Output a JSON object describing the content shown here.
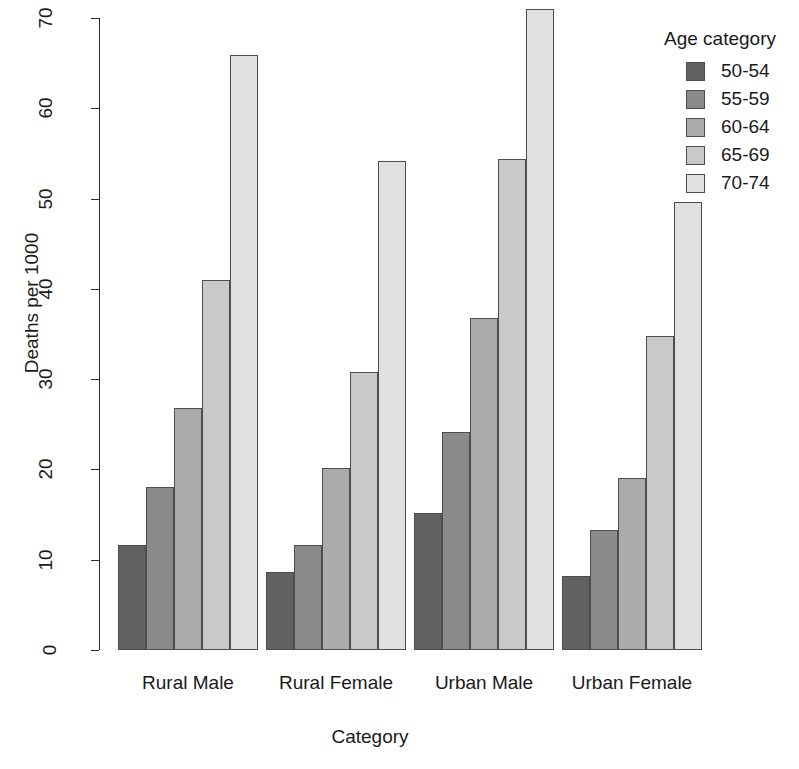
{
  "chart_data": {
    "type": "bar",
    "title": "",
    "xlabel": "Category",
    "ylabel": "Deaths per 1000",
    "categories": [
      "Rural Male",
      "Rural Female",
      "Urban Male",
      "Urban Female"
    ],
    "series": [
      {
        "name": "50-54",
        "color": "#616161",
        "values": [
          11.6,
          8.6,
          15.2,
          8.2
        ]
      },
      {
        "name": "55-59",
        "color": "#8a8a8a",
        "values": [
          18.1,
          11.6,
          24.2,
          13.3
        ]
      },
      {
        "name": "60-64",
        "color": "#ababab",
        "values": [
          26.8,
          20.2,
          36.8,
          19.0
        ]
      },
      {
        "name": "65-69",
        "color": "#c9c9c9",
        "values": [
          41.0,
          30.8,
          54.4,
          34.8
        ]
      },
      {
        "name": "70-74",
        "color": "#e0e0e0",
        "values": [
          65.9,
          54.2,
          71.0,
          49.6
        ]
      }
    ],
    "ylim": [
      0,
      70
    ],
    "yticks": [
      0,
      10,
      20,
      30,
      40,
      50,
      60,
      70
    ],
    "ytick_labels": [
      "0",
      "10",
      "20",
      "30",
      "40",
      "50",
      "60",
      "70"
    ],
    "grid": false,
    "legend": {
      "title": "Age category",
      "position": "top-right",
      "entries": [
        "50-54",
        "55-59",
        "60-64",
        "65-69",
        "70-74"
      ]
    },
    "bar_mode": "grouped",
    "axis_color": "#2b2b2b",
    "background": "#ffffff"
  }
}
